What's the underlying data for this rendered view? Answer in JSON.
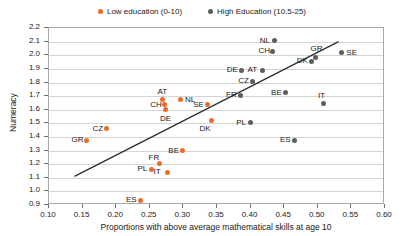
{
  "legend": {
    "entries": [
      {
        "label": "Low education (0-10)",
        "color": "#ED6C28",
        "icon": "series-dot-icon"
      },
      {
        "label": "High Education (10.5-25)",
        "color": "#5E5E5E",
        "icon": "series-dot-icon"
      }
    ]
  },
  "chart_data": {
    "type": "scatter",
    "title": "",
    "xlabel": "Proportions with above average mathematical skills at age 10",
    "ylabel": "Numeracy",
    "xlim": [
      0.1,
      0.6
    ],
    "ylim": [
      0.9,
      2.2
    ],
    "xticks": [
      "0.10",
      "0.15",
      "0.20",
      "0.25",
      "0.30",
      "0.35",
      "0.40",
      "0.45",
      "0.50",
      "0.55",
      "0.60"
    ],
    "yticks": [
      "0.9",
      "1.0",
      "1.1",
      "1.2",
      "1.3",
      "1.4",
      "1.5",
      "1.6",
      "1.7",
      "1.8",
      "1.9",
      "2.0",
      "2.1",
      "2.2"
    ],
    "grid": "horizontal",
    "legend_position": "top-center",
    "trendline": {
      "x0": 0.138,
      "y0": 1.11,
      "x1": 0.531,
      "y1": 2.1,
      "color": "#2b2b2b"
    },
    "series": [
      {
        "name": "Low education (0-10)",
        "color": "#ED6C28",
        "points": [
          {
            "label": "GR",
            "x": 0.155,
            "y": 1.375,
            "label_pos": "left"
          },
          {
            "label": "CZ",
            "x": 0.186,
            "y": 1.462,
            "label_pos": "left"
          },
          {
            "label": "ES",
            "x": 0.236,
            "y": 0.935,
            "label_pos": "left"
          },
          {
            "label": "PL",
            "x": 0.253,
            "y": 1.163,
            "label_pos": "left"
          },
          {
            "label": "FR",
            "x": 0.265,
            "y": 1.205,
            "label_pos": "upleft"
          },
          {
            "label": "CH",
            "x": 0.272,
            "y": 1.635,
            "label_pos": "left"
          },
          {
            "label": "AT",
            "x": 0.269,
            "y": 1.675,
            "label_pos": "up"
          },
          {
            "label": "DE",
            "x": 0.273,
            "y": 1.6,
            "label_pos": "down"
          },
          {
            "label": "IT",
            "x": 0.277,
            "y": 1.14,
            "label_pos": "left"
          },
          {
            "label": "NL",
            "x": 0.295,
            "y": 1.675,
            "label_pos": "right"
          },
          {
            "label": "BE",
            "x": 0.299,
            "y": 1.3,
            "label_pos": "left"
          },
          {
            "label": "SE",
            "x": 0.336,
            "y": 1.635,
            "label_pos": "left"
          },
          {
            "label": "DK",
            "x": 0.341,
            "y": 1.52,
            "label_pos": "downleft"
          }
        ]
      },
      {
        "name": "High Education (10.5-25)",
        "color": "#5E5E5E",
        "points": [
          {
            "label": "PL",
            "x": 0.4,
            "y": 1.505,
            "label_pos": "left"
          },
          {
            "label": "FR",
            "x": 0.385,
            "y": 1.705,
            "label_pos": "left"
          },
          {
            "label": "CZ",
            "x": 0.403,
            "y": 1.81,
            "label_pos": "left"
          },
          {
            "label": "DE",
            "x": 0.386,
            "y": 1.89,
            "label_pos": "left"
          },
          {
            "label": "AT",
            "x": 0.417,
            "y": 1.89,
            "label_pos": "left"
          },
          {
            "label": "CH",
            "x": 0.433,
            "y": 2.03,
            "label_pos": "left"
          },
          {
            "label": "NL",
            "x": 0.435,
            "y": 2.105,
            "label_pos": "left"
          },
          {
            "label": "BE",
            "x": 0.452,
            "y": 1.725,
            "label_pos": "left"
          },
          {
            "label": "ES",
            "x": 0.465,
            "y": 1.375,
            "label_pos": "left"
          },
          {
            "label": "DK",
            "x": 0.49,
            "y": 1.955,
            "label_pos": "left"
          },
          {
            "label": "GR",
            "x": 0.497,
            "y": 1.985,
            "label_pos": "up"
          },
          {
            "label": "IT",
            "x": 0.508,
            "y": 1.645,
            "label_pos": "up"
          },
          {
            "label": "SE",
            "x": 0.535,
            "y": 2.02,
            "label_pos": "right"
          }
        ]
      }
    ]
  }
}
